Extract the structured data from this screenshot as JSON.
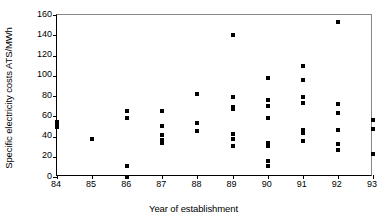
{
  "chart_data": {
    "type": "scatter",
    "title": "",
    "xlabel": "Year of establishment",
    "ylabel": "Specific electricity costs ATS/MWh",
    "xlim": [
      84,
      93
    ],
    "ylim": [
      0,
      160
    ],
    "xticks": [
      84,
      85,
      86,
      87,
      88,
      89,
      90,
      91,
      92,
      93
    ],
    "yticks": [
      0,
      20,
      40,
      60,
      80,
      100,
      120,
      140,
      160
    ],
    "xtick_labels": [
      "84",
      "85",
      "86",
      "87",
      "88",
      "89",
      "90",
      "91",
      "92",
      "93"
    ],
    "ytick_labels": [
      "0",
      "20",
      "40",
      "60",
      "80",
      "100",
      "120",
      "140",
      "160"
    ],
    "grid": false,
    "legend": null,
    "marker": "square",
    "marker_color": "#000000",
    "points": [
      {
        "x": 84,
        "y": 54
      },
      {
        "x": 84,
        "y": 51
      },
      {
        "x": 84,
        "y": 49
      },
      {
        "x": 85,
        "y": 38
      },
      {
        "x": 86,
        "y": 65
      },
      {
        "x": 86,
        "y": 58
      },
      {
        "x": 86,
        "y": 11
      },
      {
        "x": 86,
        "y": 0
      },
      {
        "x": 87,
        "y": 65
      },
      {
        "x": 87,
        "y": 50
      },
      {
        "x": 87,
        "y": 41
      },
      {
        "x": 87,
        "y": 37
      },
      {
        "x": 87,
        "y": 34
      },
      {
        "x": 88,
        "y": 82
      },
      {
        "x": 88,
        "y": 53
      },
      {
        "x": 88,
        "y": 45
      },
      {
        "x": 89,
        "y": 140
      },
      {
        "x": 89,
        "y": 79
      },
      {
        "x": 89,
        "y": 69
      },
      {
        "x": 89,
        "y": 67
      },
      {
        "x": 89,
        "y": 42
      },
      {
        "x": 89,
        "y": 38
      },
      {
        "x": 89,
        "y": 31
      },
      {
        "x": 90,
        "y": 98
      },
      {
        "x": 90,
        "y": 76
      },
      {
        "x": 90,
        "y": 70
      },
      {
        "x": 90,
        "y": 58
      },
      {
        "x": 90,
        "y": 34
      },
      {
        "x": 90,
        "y": 31
      },
      {
        "x": 90,
        "y": 16
      },
      {
        "x": 90,
        "y": 11
      },
      {
        "x": 91,
        "y": 110
      },
      {
        "x": 91,
        "y": 96
      },
      {
        "x": 91,
        "y": 79
      },
      {
        "x": 91,
        "y": 73
      },
      {
        "x": 91,
        "y": 46
      },
      {
        "x": 91,
        "y": 43
      },
      {
        "x": 91,
        "y": 36
      },
      {
        "x": 92,
        "y": 153
      },
      {
        "x": 92,
        "y": 72
      },
      {
        "x": 92,
        "y": 63
      },
      {
        "x": 92,
        "y": 46
      },
      {
        "x": 92,
        "y": 33
      },
      {
        "x": 92,
        "y": 27
      },
      {
        "x": 93,
        "y": 56
      },
      {
        "x": 93,
        "y": 47
      },
      {
        "x": 93,
        "y": 23
      }
    ]
  }
}
